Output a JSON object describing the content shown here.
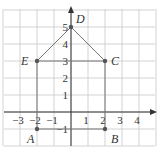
{
  "diagram": {
    "type": "coordinate-plane-polygon",
    "grid": {
      "x_min": -4,
      "x_max": 5,
      "y_min": -2,
      "y_max": 6,
      "origin_px": [
        71,
        112
      ],
      "unit_px": 17,
      "grid_color": "#c8c8c8",
      "axis_color": "#333333"
    },
    "x_tick_labels": [
      {
        "value": -3,
        "label": "−3"
      },
      {
        "value": -2,
        "label": "−2"
      },
      {
        "value": -1,
        "label": "−1"
      },
      {
        "value": 1,
        "label": "1"
      },
      {
        "value": 2,
        "label": "2"
      },
      {
        "value": 3,
        "label": "3"
      },
      {
        "value": 4,
        "label": "4"
      }
    ],
    "y_tick_labels": [
      {
        "value": 1,
        "label": "1"
      },
      {
        "value": 2,
        "label": "2"
      },
      {
        "value": 3,
        "label": "3"
      },
      {
        "value": 4,
        "label": "4"
      },
      {
        "value": 5,
        "label": "5"
      },
      {
        "value": -1,
        "label": "−1"
      }
    ],
    "points": [
      {
        "name": "A",
        "x": -2,
        "y": -1
      },
      {
        "name": "B",
        "x": 2,
        "y": -1
      },
      {
        "name": "C",
        "x": 2,
        "y": 3
      },
      {
        "name": "D",
        "x": 0,
        "y": 5
      },
      {
        "name": "E",
        "x": -2,
        "y": 3
      }
    ],
    "segments": [
      [
        "A",
        "E"
      ],
      [
        "E",
        "C"
      ],
      [
        "C",
        "B"
      ],
      [
        "B",
        "A"
      ],
      [
        "E",
        "D"
      ],
      [
        "D",
        "C"
      ]
    ],
    "line_color": "#777777",
    "point_color": "#555555"
  }
}
